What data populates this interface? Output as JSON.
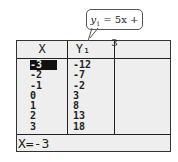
{
  "callout": {
    "var": "y",
    "sub": "1",
    "expr": " = 5x + 3"
  },
  "table": {
    "headers": [
      "X",
      "Y₁",
      ""
    ],
    "x": [
      "-3",
      "-2",
      "-1",
      "0",
      "1",
      "2",
      "3"
    ],
    "y1": [
      "-12",
      "-7",
      "-2",
      "3",
      "8",
      "13",
      "18"
    ],
    "selected_row": 0
  },
  "footer": {
    "text": "X=-3"
  }
}
